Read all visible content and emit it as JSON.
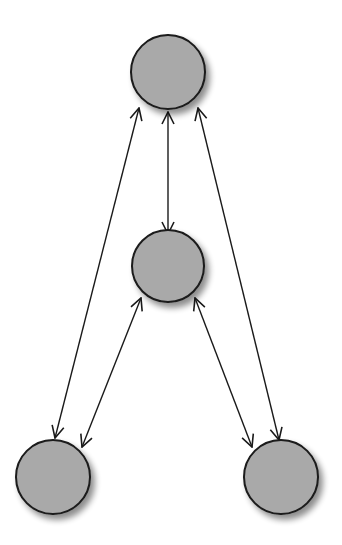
{
  "diagram": {
    "type": "graph",
    "directed": true,
    "bidirectional_edges": true,
    "colors": {
      "node_fill": "#a9a9a9",
      "node_stroke": "#1a1a1a",
      "edge": "#1a1a1a",
      "shadow": "#9a9a9a",
      "background": "#ffffff"
    },
    "nodes": [
      {
        "id": "top",
        "label": "",
        "cx": 168,
        "cy": 72,
        "r": 37
      },
      {
        "id": "middle",
        "label": "",
        "cx": 168,
        "cy": 266,
        "r": 36
      },
      {
        "id": "bottom-left",
        "label": "",
        "cx": 53,
        "cy": 477,
        "r": 37
      },
      {
        "id": "bottom-right",
        "label": "",
        "cx": 281,
        "cy": 477,
        "r": 37
      }
    ],
    "edges": [
      {
        "from": "top",
        "to": "middle",
        "bidirectional": true,
        "x1": 168,
        "y1": 112,
        "x2": 168,
        "y2": 234
      },
      {
        "from": "top",
        "to": "bottom-left",
        "bidirectional": true,
        "x1": 139,
        "y1": 108,
        "x2": 55,
        "y2": 438
      },
      {
        "from": "top",
        "to": "bottom-right",
        "bidirectional": true,
        "x1": 198,
        "y1": 108,
        "x2": 279,
        "y2": 440
      },
      {
        "from": "middle",
        "to": "bottom-left",
        "bidirectional": true,
        "x1": 141,
        "y1": 298,
        "x2": 82,
        "y2": 447
      },
      {
        "from": "middle",
        "to": "bottom-right",
        "bidirectional": true,
        "x1": 195,
        "y1": 298,
        "x2": 252,
        "y2": 447
      }
    ]
  }
}
